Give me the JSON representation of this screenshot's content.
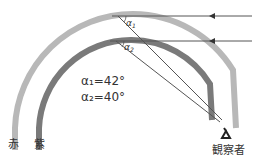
{
  "diagram": {
    "type": "rainbow-angle-diagram",
    "labels": {
      "red": "赤",
      "violet": "紫",
      "observer": "観察者",
      "alpha1_symbol": "α",
      "alpha1_sub": "1",
      "alpha2_symbol": "α",
      "alpha2_sub": "2",
      "eq1": "α₁=42°",
      "eq2": "α₂=40°"
    },
    "angles": {
      "alpha1_deg": 42,
      "alpha2_deg": 40
    },
    "colors": {
      "red_arc": "#b8b8b8",
      "violet_arc": "#7a7a7a",
      "lines": "#555555",
      "text": "#333333"
    },
    "icons": [
      "eye-icon",
      "arrow-left-icon"
    ]
  }
}
